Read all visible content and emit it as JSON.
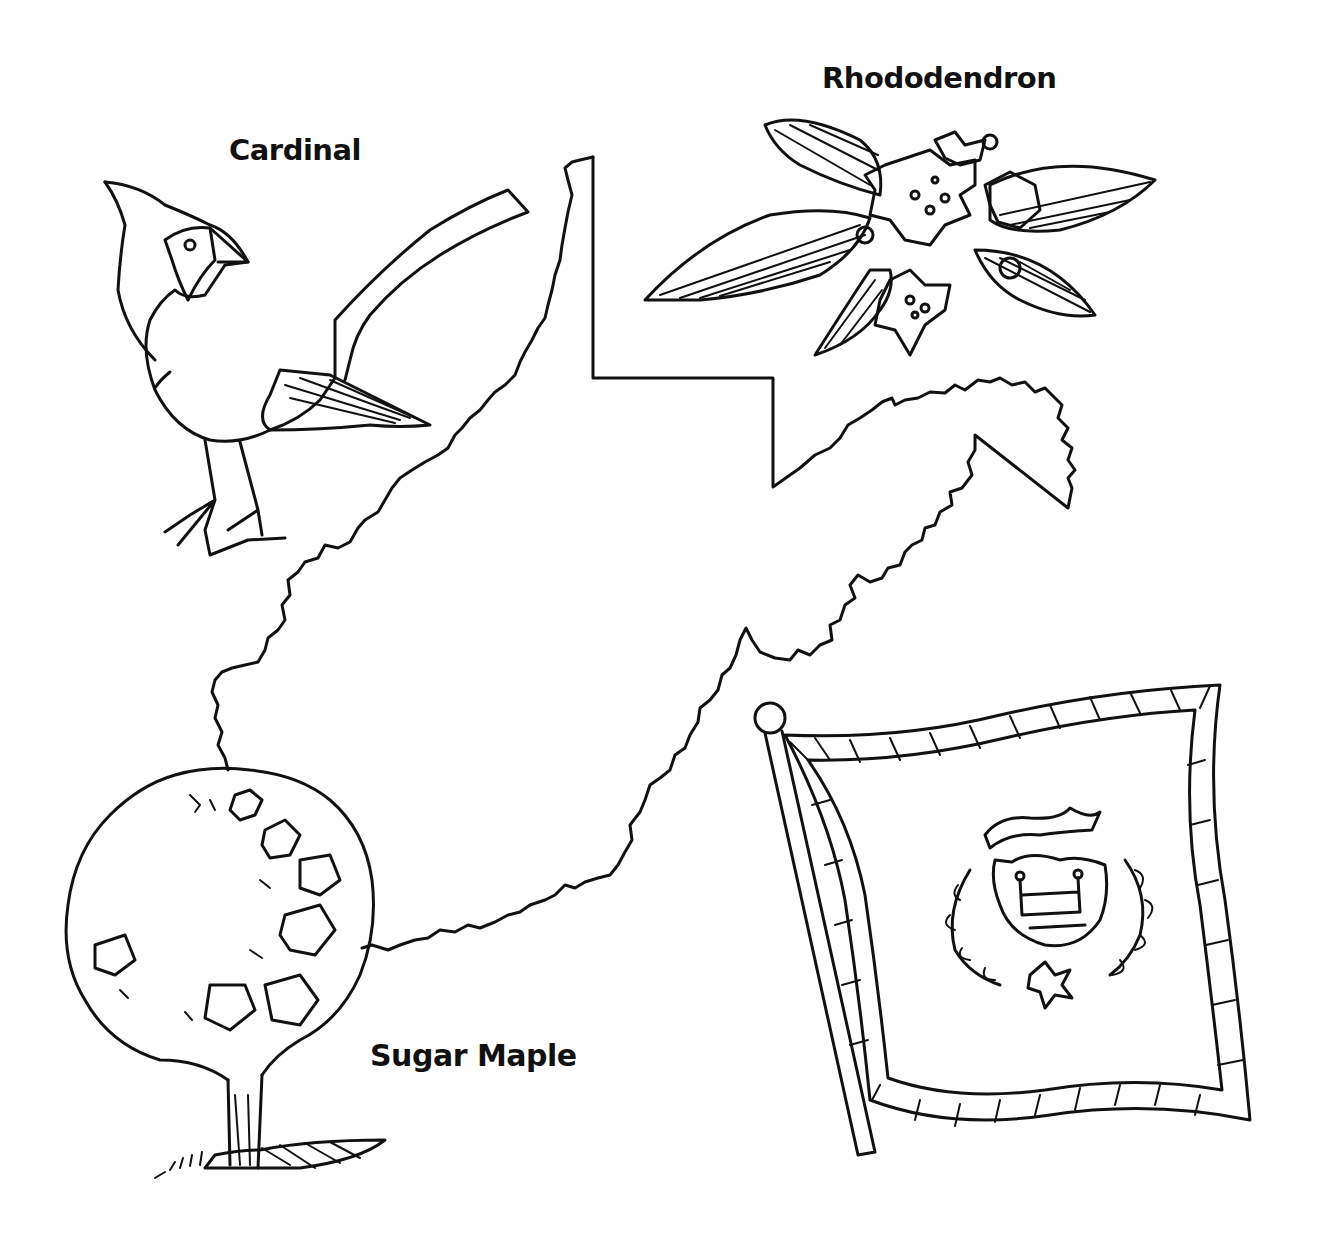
{
  "page": {
    "colors": {
      "ink": "#111111",
      "paper": "#ffffff"
    }
  },
  "labels": {
    "bird": "Cardinal",
    "flower": "Rhododendron",
    "tree": "Sugar Maple"
  },
  "illustrations": [
    {
      "name": "state-map",
      "description": "West Virginia outline"
    },
    {
      "name": "cardinal",
      "description": "state bird"
    },
    {
      "name": "rhododendron",
      "description": "state flower"
    },
    {
      "name": "sugar-maple",
      "description": "state tree"
    },
    {
      "name": "state-flag",
      "description": "flag with coat of arms"
    }
  ]
}
